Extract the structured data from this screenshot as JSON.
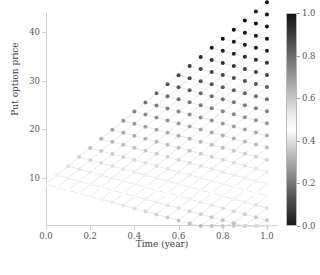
{
  "chart_data": {
    "type": "scatter",
    "title": "",
    "xlabel": "Time (year)",
    "ylabel": "Put option price",
    "xlim": [
      0.0,
      1.05
    ],
    "ylim": [
      0.0,
      44.0
    ],
    "xticks": [
      0.0,
      0.2,
      0.4,
      0.6,
      0.8,
      1.0
    ],
    "xticklabels": [
      "0.0",
      "0.2",
      "0.4",
      "0.6",
      "0.8",
      "1.0"
    ],
    "yticks": [
      10,
      20,
      30,
      40
    ],
    "yticklabels": [
      "10",
      "20",
      "30",
      "40"
    ],
    "grid": false,
    "legend": null,
    "colorbar": {
      "label": "",
      "vmin": 0.0,
      "vmax": 1.0,
      "ticks": [
        0.0,
        0.2,
        0.4,
        0.6,
        0.8,
        1.0
      ],
      "ticklabels": [
        "0.0",
        "0.2",
        "0.4",
        "0.6",
        "0.8",
        "1.0"
      ],
      "orientation": "vertical",
      "cmap": "gray-diverging",
      "cmap_stops": [
        {
          "pos": 0.0,
          "color": "#1a1a1a"
        },
        {
          "pos": 0.12,
          "color": "#4d4d4d"
        },
        {
          "pos": 0.24,
          "color": "#8c8c8c"
        },
        {
          "pos": 0.36,
          "color": "#c9c9c9"
        },
        {
          "pos": 0.45,
          "color": "#ffffff"
        },
        {
          "pos": 0.52,
          "color": "#ededed"
        },
        {
          "pos": 0.64,
          "color": "#b5b5b5"
        },
        {
          "pos": 0.78,
          "color": "#757575"
        },
        {
          "pos": 0.9,
          "color": "#3d3d3d"
        },
        {
          "pos": 1.0,
          "color": "#111111"
        }
      ]
    },
    "marker": "o",
    "marker_size": 3.4,
    "edge_color": "#d8d8d8",
    "edge_width": 0.6,
    "steps": 20,
    "dt": 0.05,
    "root": {
      "t": 0.0,
      "price": 8.6,
      "value": 0.03
    },
    "up_step": 1.88,
    "down_step": -0.62,
    "tree": {
      "s0": 100.0,
      "strike": 100.0,
      "u": 1.0905,
      "d": 0.917,
      "note": "node price = max(K - S, discounted continuation); upper boundary grows to ~41 at t=1.0"
    }
  },
  "figure": {
    "width": 320,
    "height": 275,
    "facecolor": "#ffffff",
    "axes_color": "#cfcfcf",
    "text_color": "#4a4a4a"
  }
}
